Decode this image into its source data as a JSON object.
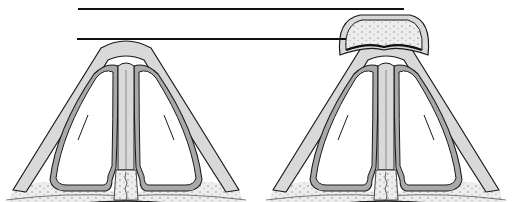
{
  "figure": {
    "type": "anatomical-cross-section-diagram",
    "panels": [
      {
        "id": "left",
        "description": "cross-section without elevated cap; apex touches lower reference line"
      },
      {
        "id": "right",
        "description": "cross-section with dotted cap elevated above apex; cap reaches upper reference line"
      }
    ],
    "reference_lines": [
      {
        "id": "upper",
        "y": 9,
        "x1": 78,
        "x2": 404
      },
      {
        "id": "lower",
        "y": 39,
        "x1": 77,
        "x2": 340
      }
    ],
    "colors": {
      "outline": "#1a1a1a",
      "light_fill": "#d9d9d9",
      "mid_fill": "#a9a9a9",
      "bone_fill": "#ededed",
      "dots": "#b5b5b5",
      "background": "#ffffff"
    }
  }
}
